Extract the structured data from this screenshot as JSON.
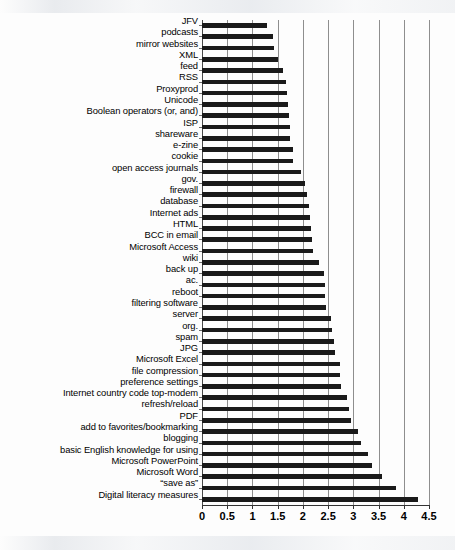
{
  "chart_data": {
    "type": "bar",
    "orientation": "horizontal",
    "title": "",
    "subtitle": "",
    "xlabel": "",
    "ylabel": "",
    "xlim": [
      0,
      4.5
    ],
    "xticks": [
      "0",
      "0.5",
      "1",
      "1.5",
      "2",
      "2.5",
      "3",
      "3.5",
      "4",
      "4.5"
    ],
    "xtick_values": [
      0,
      0.5,
      1,
      1.5,
      2,
      2.5,
      3,
      3.5,
      4,
      4.5
    ],
    "grid": "vertical",
    "legend": "none",
    "series_name": "mean score",
    "bar_color": "#1a1a1a",
    "categories": [
      "JFV",
      "podcasts",
      "mirror websites",
      "XML",
      "feed",
      "RSS",
      "Proxyprod",
      "Unicode",
      "Boolean operators (or, and)",
      "ISP",
      "shareware",
      "e-zine",
      "cookie",
      "open access journals",
      "gov.",
      "firewall",
      "database",
      "Internet ads",
      "HTML",
      "BCC in email",
      "Microsoft Access",
      "wiki",
      "back up",
      "ac.",
      "reboot",
      "filtering software",
      "server",
      "org.",
      "spam",
      "JPG",
      "Microsoft Excel",
      "file compression",
      "preference settings",
      "Internet country code top-modem",
      "refresh/reload",
      "PDF",
      "add to favorites/bookmarking",
      "blogging",
      "basic English knowledge for using",
      "Microsoft PowerPoint",
      "Microsoft Word",
      "“save as”",
      "Digital literacy measures"
    ],
    "values": [
      1.29,
      1.4,
      1.43,
      1.51,
      1.61,
      1.66,
      1.68,
      1.7,
      1.72,
      1.74,
      1.75,
      1.8,
      1.81,
      1.97,
      2.05,
      2.09,
      2.13,
      2.15,
      2.16,
      2.18,
      2.21,
      2.32,
      2.42,
      2.43,
      2.44,
      2.45,
      2.55,
      2.58,
      2.62,
      2.64,
      2.73,
      2.74,
      2.76,
      2.87,
      2.92,
      2.95,
      3.09,
      3.15,
      3.29,
      3.37,
      3.57,
      3.85,
      4.28
    ]
  }
}
